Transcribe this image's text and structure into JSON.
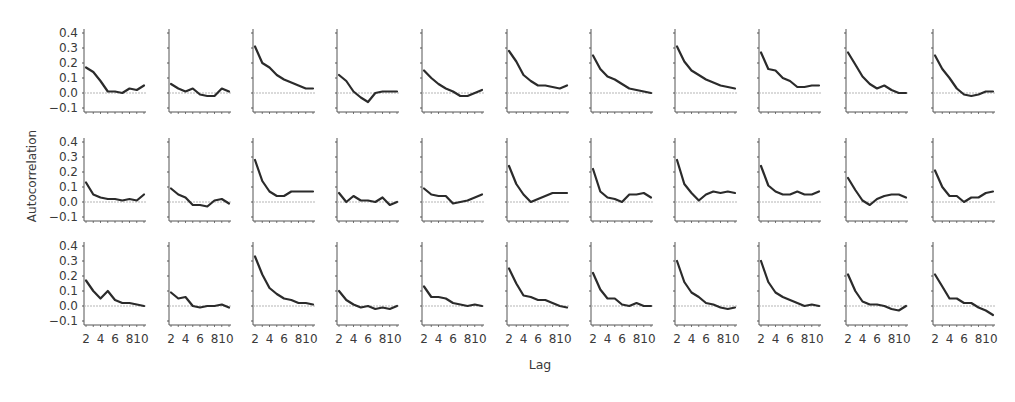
{
  "chart_data": {
    "type": "line",
    "title": "",
    "xlabel": "Lag",
    "ylabel": "Autocorrelation",
    "layout": {
      "rows": 3,
      "cols": 11,
      "grid": false,
      "zero_reference_line": true,
      "legend": "none"
    },
    "x": [
      2,
      3,
      4,
      5,
      6,
      7,
      8,
      9,
      10
    ],
    "xticks": [
      "2",
      "4",
      "6",
      "8",
      "10"
    ],
    "xlim": [
      2,
      10
    ],
    "yticks": [
      "0.4",
      "0.3",
      "0.2",
      "0.1",
      "0.0",
      "−0.1"
    ],
    "ylim": [
      -0.1,
      0.4
    ],
    "panels": [
      [
        [
          0.17,
          0.14,
          0.08,
          0.01,
          0.01,
          0.0,
          0.03,
          0.02,
          0.05
        ],
        [
          0.06,
          0.03,
          0.01,
          0.03,
          -0.01,
          -0.02,
          -0.02,
          0.03,
          0.01
        ],
        [
          0.31,
          0.2,
          0.17,
          0.12,
          0.09,
          0.07,
          0.05,
          0.03,
          0.03
        ],
        [
          0.12,
          0.08,
          0.01,
          -0.03,
          -0.06,
          0.0,
          0.01,
          0.01,
          0.01
        ],
        [
          0.15,
          0.1,
          0.06,
          0.03,
          0.01,
          -0.02,
          -0.02,
          0.0,
          0.02
        ],
        [
          0.28,
          0.21,
          0.12,
          0.08,
          0.05,
          0.05,
          0.04,
          0.03,
          0.05
        ],
        [
          0.25,
          0.16,
          0.11,
          0.09,
          0.06,
          0.03,
          0.02,
          0.01,
          0.0
        ],
        [
          0.31,
          0.21,
          0.15,
          0.12,
          0.09,
          0.07,
          0.05,
          0.04,
          0.03
        ],
        [
          0.27,
          0.16,
          0.15,
          0.1,
          0.08,
          0.04,
          0.04,
          0.05,
          0.05
        ],
        [
          0.27,
          0.19,
          0.11,
          0.06,
          0.03,
          0.05,
          0.02,
          0.0,
          0.0
        ],
        [
          0.25,
          0.16,
          0.1,
          0.03,
          -0.01,
          -0.02,
          -0.01,
          0.01,
          0.01
        ]
      ],
      [
        [
          0.13,
          0.05,
          0.03,
          0.02,
          0.02,
          0.01,
          0.02,
          0.01,
          0.05
        ],
        [
          0.09,
          0.05,
          0.03,
          -0.02,
          -0.02,
          -0.03,
          0.01,
          0.02,
          -0.01
        ],
        [
          0.28,
          0.14,
          0.07,
          0.04,
          0.04,
          0.07,
          0.07,
          0.07,
          0.07
        ],
        [
          0.06,
          0.0,
          0.04,
          0.01,
          0.01,
          0.0,
          0.03,
          -0.02,
          0.0
        ],
        [
          0.09,
          0.05,
          0.04,
          0.04,
          -0.01,
          0.0,
          0.01,
          0.03,
          0.05
        ],
        [
          0.24,
          0.12,
          0.05,
          0.0,
          0.02,
          0.04,
          0.06,
          0.06,
          0.06
        ],
        [
          0.22,
          0.07,
          0.03,
          0.02,
          0.0,
          0.05,
          0.05,
          0.06,
          0.03
        ],
        [
          0.28,
          0.12,
          0.06,
          0.01,
          0.05,
          0.07,
          0.06,
          0.07,
          0.06
        ],
        [
          0.24,
          0.11,
          0.07,
          0.05,
          0.05,
          0.07,
          0.05,
          0.05,
          0.07
        ],
        [
          0.16,
          0.08,
          0.01,
          -0.02,
          0.02,
          0.04,
          0.05,
          0.05,
          0.03
        ],
        [
          0.21,
          0.1,
          0.04,
          0.04,
          0.0,
          0.03,
          0.03,
          0.06,
          0.07
        ]
      ],
      [
        [
          0.17,
          0.1,
          0.05,
          0.1,
          0.04,
          0.02,
          0.02,
          0.01,
          0.0
        ],
        [
          0.09,
          0.05,
          0.06,
          0.0,
          -0.01,
          0.0,
          0.0,
          0.01,
          -0.01
        ],
        [
          0.33,
          0.21,
          0.12,
          0.08,
          0.05,
          0.04,
          0.02,
          0.02,
          0.01
        ],
        [
          0.1,
          0.04,
          0.01,
          -0.01,
          0.0,
          -0.02,
          -0.01,
          -0.02,
          0.0
        ],
        [
          0.13,
          0.06,
          0.06,
          0.05,
          0.02,
          0.01,
          0.0,
          0.01,
          0.0
        ],
        [
          0.25,
          0.15,
          0.07,
          0.06,
          0.04,
          0.04,
          0.02,
          0.0,
          -0.01
        ],
        [
          0.22,
          0.11,
          0.05,
          0.05,
          0.01,
          0.0,
          0.02,
          0.0,
          0.0
        ],
        [
          0.3,
          0.16,
          0.09,
          0.06,
          0.02,
          0.01,
          -0.01,
          -0.02,
          -0.01
        ],
        [
          0.3,
          0.16,
          0.09,
          0.06,
          0.04,
          0.02,
          0.0,
          0.01,
          0.0
        ],
        [
          0.21,
          0.1,
          0.03,
          0.01,
          0.01,
          0.0,
          -0.02,
          -0.03,
          0.0
        ],
        [
          0.21,
          0.13,
          0.05,
          0.05,
          0.02,
          0.02,
          -0.01,
          -0.03,
          -0.06
        ]
      ]
    ]
  },
  "colors": {
    "line": "#2b2b2b",
    "axis": "#555555",
    "zero_line": "#b5b5b5",
    "text": "#3a3a3a"
  }
}
